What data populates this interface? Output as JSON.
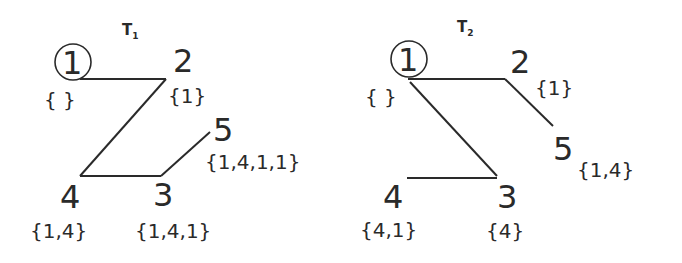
{
  "trees": [
    {
      "title": "T",
      "subscript": "1",
      "nodes": [
        {
          "id": "1",
          "label": "1",
          "set": "{ }",
          "root": true
        },
        {
          "id": "2",
          "label": "2",
          "set": "{1}"
        },
        {
          "id": "3",
          "label": "3",
          "set": "{1,4,1}"
        },
        {
          "id": "4",
          "label": "4",
          "set": "{1,4}"
        },
        {
          "id": "5",
          "label": "5",
          "set": "{1,4,1,1}"
        }
      ],
      "edges": [
        [
          "1",
          "2"
        ],
        [
          "2",
          "4"
        ],
        [
          "4",
          "3"
        ],
        [
          "3",
          "5"
        ]
      ]
    },
    {
      "title": "T",
      "subscript": "2",
      "nodes": [
        {
          "id": "1",
          "label": "1",
          "set": "{ }",
          "root": true
        },
        {
          "id": "2",
          "label": "2",
          "set": "{1}"
        },
        {
          "id": "3",
          "label": "3",
          "set": "{4}"
        },
        {
          "id": "4",
          "label": "4",
          "set": "{4,1}"
        },
        {
          "id": "5",
          "label": "5",
          "set": "{1,4}"
        }
      ],
      "edges": [
        [
          "1",
          "2"
        ],
        [
          "2",
          "5"
        ],
        [
          "1",
          "3"
        ],
        [
          "4",
          "3"
        ]
      ]
    }
  ]
}
